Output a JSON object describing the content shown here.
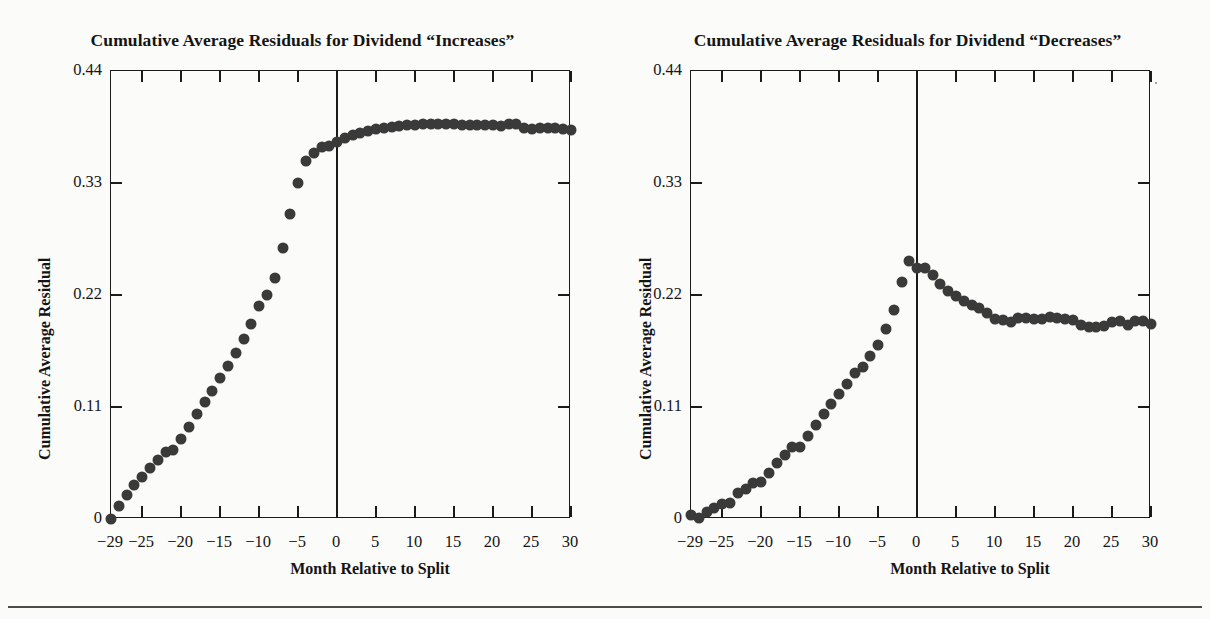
{
  "figure": {
    "background": "#fbfbf9",
    "marker_color": "#3a3a3a",
    "axis_color": "#1a1a1a"
  },
  "panels": [
    {
      "id": "increases",
      "title": "Cumulative Average Residuals for Dividend “Increases”",
      "xlabel": "Month Relative to Split",
      "ylabel": "Cumulative Average Residual"
    },
    {
      "id": "decreases",
      "title": "Cumulative Average Residuals for Dividend “Decreases”",
      "xlabel": "Month Relative to Split",
      "ylabel": "Cumulative Average Residual"
    }
  ],
  "axes": {
    "x_tick_labels": [
      "−29",
      "−25",
      "−20",
      "−15",
      "−10",
      "−5",
      "0",
      "5",
      "10",
      "15",
      "20",
      "25",
      "30"
    ],
    "x_tick_values": [
      -29,
      -25,
      -20,
      -15,
      -10,
      -5,
      0,
      5,
      10,
      15,
      20,
      25,
      30
    ],
    "x_major_ticks": [
      -25,
      -20,
      -15,
      -10,
      -5,
      0,
      5,
      10,
      15,
      20,
      25,
      30
    ],
    "y_tick_labels": [
      "0.44",
      "0.33",
      "0.22",
      "0.11",
      "0"
    ],
    "y_tick_values": [
      0.44,
      0.33,
      0.22,
      0.11,
      0
    ],
    "y_inner_ticks": [
      0.33,
      0.22,
      0.11
    ],
    "xlim": [
      -29,
      30
    ],
    "ylim": [
      0,
      0.44
    ],
    "event_line_x": 0,
    "grid": false
  },
  "chart_data": [
    {
      "type": "scatter",
      "title": "Cumulative Average Residuals for Dividend “Increases”",
      "xlabel": "Month Relative to Split",
      "ylabel": "Cumulative Average Residual",
      "xlim": [
        -29,
        30
      ],
      "ylim": [
        0,
        0.44
      ],
      "grid": false,
      "legend": null,
      "x": [
        -29,
        -28,
        -27,
        -26,
        -25,
        -24,
        -23,
        -22,
        -21,
        -20,
        -19,
        -18,
        -17,
        -16,
        -15,
        -14,
        -13,
        -12,
        -11,
        -10,
        -9,
        -8,
        -7,
        -6,
        -5,
        -4,
        -3,
        -2,
        -1,
        0,
        1,
        2,
        3,
        4,
        5,
        6,
        7,
        8,
        9,
        10,
        11,
        12,
        13,
        14,
        15,
        16,
        17,
        18,
        19,
        20,
        21,
        22,
        23,
        24,
        25,
        26,
        27,
        28,
        29,
        30
      ],
      "y": [
        0.0,
        0.013,
        0.024,
        0.033,
        0.041,
        0.05,
        0.058,
        0.066,
        0.068,
        0.079,
        0.09,
        0.103,
        0.115,
        0.126,
        0.138,
        0.15,
        0.163,
        0.177,
        0.192,
        0.209,
        0.22,
        0.237,
        0.266,
        0.3,
        0.33,
        0.352,
        0.359,
        0.365,
        0.366,
        0.37,
        0.374,
        0.377,
        0.379,
        0.381,
        0.383,
        0.384,
        0.385,
        0.386,
        0.387,
        0.387,
        0.388,
        0.388,
        0.388,
        0.388,
        0.388,
        0.387,
        0.387,
        0.387,
        0.387,
        0.387,
        0.386,
        0.388,
        0.388,
        0.384,
        0.383,
        0.384,
        0.384,
        0.384,
        0.383,
        0.382
      ]
    },
    {
      "type": "scatter",
      "title": "Cumulative Average Residuals for Dividend “Decreases”",
      "xlabel": "Month Relative to Split",
      "ylabel": "Cumulative Average Residual",
      "xlim": [
        -29,
        30
      ],
      "ylim": [
        0,
        0.44
      ],
      "grid": false,
      "legend": null,
      "x": [
        -29,
        -28,
        -27,
        -26,
        -25,
        -24,
        -23,
        -22,
        -21,
        -20,
        -19,
        -18,
        -17,
        -16,
        -15,
        -14,
        -13,
        -12,
        -11,
        -10,
        -9,
        -8,
        -7,
        -6,
        -5,
        -4,
        -3,
        -2,
        -1,
        0,
        1,
        2,
        3,
        4,
        5,
        6,
        7,
        8,
        9,
        10,
        11,
        12,
        13,
        14,
        15,
        16,
        17,
        18,
        19,
        20,
        21,
        22,
        23,
        24,
        25,
        26,
        27,
        28,
        29,
        30
      ],
      "y": [
        0.004,
        0.001,
        0.007,
        0.011,
        0.015,
        0.016,
        0.026,
        0.029,
        0.035,
        0.036,
        0.045,
        0.055,
        0.063,
        0.071,
        0.071,
        0.082,
        0.092,
        0.103,
        0.113,
        0.123,
        0.133,
        0.143,
        0.149,
        0.16,
        0.171,
        0.187,
        0.205,
        0.233,
        0.253,
        0.247,
        0.247,
        0.24,
        0.231,
        0.224,
        0.219,
        0.214,
        0.21,
        0.207,
        0.202,
        0.196,
        0.195,
        0.193,
        0.197,
        0.197,
        0.196,
        0.196,
        0.198,
        0.197,
        0.196,
        0.195,
        0.191,
        0.189,
        0.189,
        0.19,
        0.193,
        0.194,
        0.191,
        0.194,
        0.194,
        0.192
      ]
    }
  ]
}
